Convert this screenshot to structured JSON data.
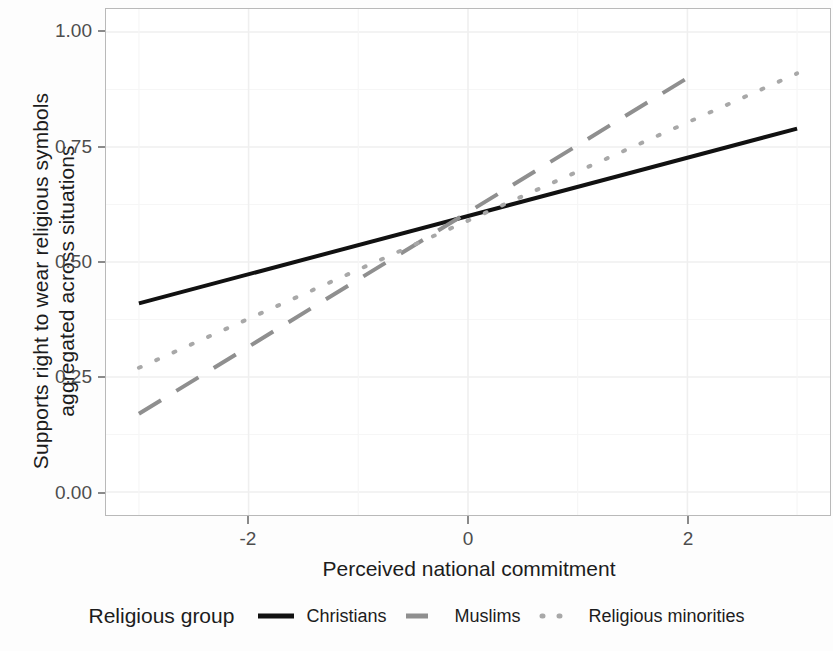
{
  "chart_data": {
    "type": "line",
    "title": "",
    "xlabel": "Perceived national commitment",
    "ylabel_line1": "Supports right to wear religious symbols",
    "ylabel_line2": "aggregated across situations",
    "xlim": [
      -3.3,
      3.3
    ],
    "ylim": [
      -0.05,
      1.05
    ],
    "xticks": [
      "-2",
      "0",
      "2"
    ],
    "xtick_values": [
      -2,
      0,
      2
    ],
    "yticks": [
      "0.00",
      "0.25",
      "0.50",
      "0.75",
      "1.00"
    ],
    "ytick_values": [
      0.0,
      0.25,
      0.5,
      0.75,
      1.0
    ],
    "grid": true,
    "legend_position": "bottom",
    "legend_title": "Religious group",
    "series": [
      {
        "name": "Christians",
        "linestyle": "solid",
        "color": "#111111",
        "width": 4,
        "x": [
          -3.0,
          3.0
        ],
        "y": [
          0.41,
          0.79
        ]
      },
      {
        "name": "Muslims",
        "linestyle": "dashed",
        "color": "#8f8f8f",
        "width": 4,
        "x": [
          -3.0,
          2.0
        ],
        "y": [
          0.17,
          0.9
        ]
      },
      {
        "name": "Religious minorities",
        "linestyle": "dotted",
        "color": "#a8a8a8",
        "width": 4,
        "x": [
          -3.0,
          3.0
        ],
        "y": [
          0.27,
          0.91
        ]
      }
    ]
  },
  "axis": {
    "y_label_line1": "Supports right to wear religious symbols",
    "y_label_line2": "aggregated across situations",
    "x_label": "Perceived national commitment",
    "y_tick_labels": [
      "1.00",
      "0.75",
      "0.50",
      "0.25",
      "0.00"
    ],
    "x_tick_labels": [
      "-2",
      "0",
      "2"
    ]
  },
  "legend": {
    "title": "Religious group",
    "items": [
      {
        "label": "Christians",
        "style": "solid",
        "color": "#111111"
      },
      {
        "label": "Muslims",
        "style": "dashed",
        "color": "#8f8f8f"
      },
      {
        "label": "Religious minorities",
        "style": "dotted",
        "color": "#a8a8a8"
      }
    ]
  },
  "colors": {
    "panel_border": "#b9b9b9",
    "gridline": "#efefef",
    "tick_text": "#4d4d4d",
    "axis_title": "#1c1c1c"
  }
}
